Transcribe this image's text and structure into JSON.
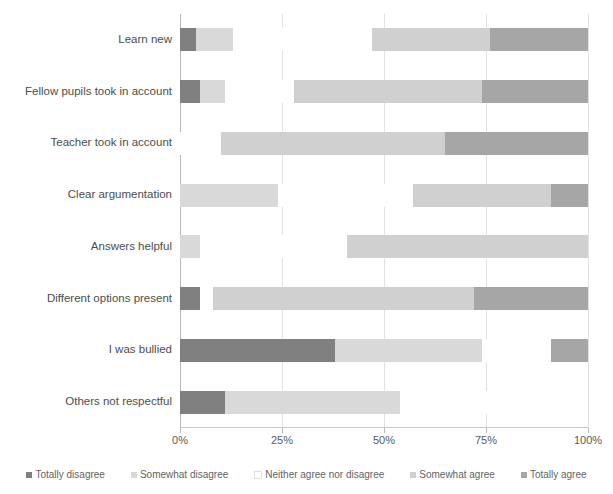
{
  "chart_data": {
    "type": "bar",
    "subtype": "stacked-horizontal-100percent",
    "title": "",
    "xlabel": "",
    "ylabel": "",
    "xlim": [
      0,
      100
    ],
    "xticks": [
      "0%",
      "25%",
      "50%",
      "75%",
      "100%"
    ],
    "xtick_values": [
      0,
      25,
      50,
      75,
      100
    ],
    "grid": true,
    "legend_position": "bottom",
    "orientation": "horizontal",
    "categories": [
      "Learn new",
      "Fellow pupils took in account",
      "Teacher took in account",
      "Clear argumentation",
      "Answers helpful",
      "Different options present",
      "I was bullied",
      "Others not respectful"
    ],
    "series": [
      {
        "name": "Totally disagree",
        "color": "#808080",
        "values": [
          4,
          5,
          0,
          0,
          0,
          5,
          38,
          11
        ]
      },
      {
        "name": "Somewhat disagree",
        "color": "#d9d9d9",
        "values": [
          9,
          6,
          0,
          24,
          5,
          0,
          36,
          43
        ]
      },
      {
        "name": "Neither agree nor disagree",
        "color": "#ffffff",
        "values": [
          34,
          17,
          10,
          33,
          36,
          3,
          17,
          46
        ]
      },
      {
        "name": "Somewhat agree",
        "color": "#d0d0d0",
        "values": [
          29,
          46,
          55,
          34,
          59,
          64,
          0,
          0
        ]
      },
      {
        "name": "Totally agree",
        "color": "#a6a6a6",
        "values": [
          24,
          26,
          35,
          9,
          0,
          28,
          9,
          0
        ]
      }
    ]
  },
  "legend": {
    "items": [
      {
        "label": "Totally disagree",
        "color": "#808080"
      },
      {
        "label": "Somewhat disagree",
        "color": "#d9d9d9"
      },
      {
        "label": "Neither agree nor disagree",
        "color": "#ffffff"
      },
      {
        "label": "Somewhat agree",
        "color": "#d0d0d0"
      },
      {
        "label": "Totally agree",
        "color": "#a6a6a6"
      }
    ]
  },
  "axis": {
    "gridline_color": "#e2e2e2",
    "axis_color": "#b9b9b9",
    "text_color": "#595959"
  }
}
